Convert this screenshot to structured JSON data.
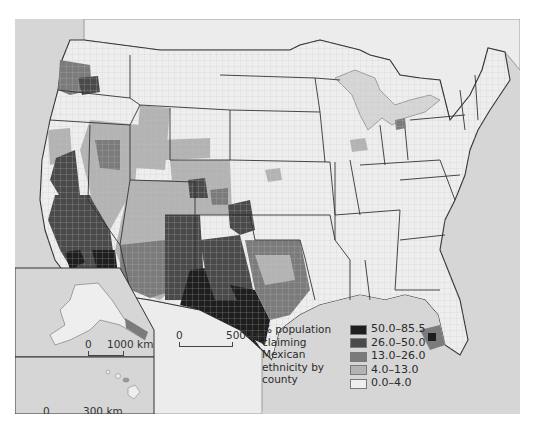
{
  "map": {
    "subject": "Mexican ethnicity by county, United States",
    "colors": {
      "ocean": "#d6d6d6",
      "land_outside": "#ececec",
      "border": "#333333",
      "county_line": "#bdbdbd"
    }
  },
  "legend": {
    "title_lines": [
      "% population",
      "claiming",
      "Mexican",
      "ethnicity by",
      "county"
    ],
    "items": [
      {
        "label": "50.0–85.5",
        "color": "#1e1e1e"
      },
      {
        "label": "26.0–50.0",
        "color": "#4a4a4a"
      },
      {
        "label": "13.0–26.0",
        "color": "#7b7b7b"
      },
      {
        "label": "4.0–13.0",
        "color": "#b3b3b3"
      },
      {
        "label": "0.0–4.0",
        "color": "#eeeeee"
      }
    ]
  },
  "scales": {
    "main": {
      "zero": "0",
      "distance": "500 km"
    },
    "alaska": {
      "zero": "0",
      "distance": "1000 km"
    },
    "hawaii": {
      "zero": "0",
      "distance": "300 km"
    }
  },
  "insets": [
    "Alaska",
    "Hawaii"
  ]
}
